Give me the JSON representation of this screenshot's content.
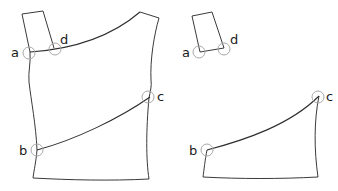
{
  "diagram": {
    "colors": {
      "outline": "#3a3a3a",
      "marker": "#a8a8a8",
      "label": "#1a1a1a"
    },
    "left_figure": {
      "labels": {
        "a": "a",
        "b": "b",
        "c": "c",
        "d": "d"
      }
    },
    "right_figure": {
      "labels": {
        "a": "a",
        "b": "b",
        "c": "c",
        "d": "d"
      }
    }
  }
}
